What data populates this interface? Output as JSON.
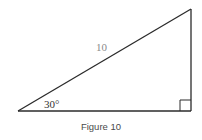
{
  "figure": {
    "caption": "Figure 10",
    "shape": "right triangle",
    "hypotenuse_label": "10",
    "angle_label": "30°",
    "right_angle_marker": true,
    "colors": {
      "lines": "#2b2b2b",
      "hypotenuse_label": "#8a8a8a",
      "angle_label": "#333333",
      "caption": "#4a4a4a"
    }
  }
}
